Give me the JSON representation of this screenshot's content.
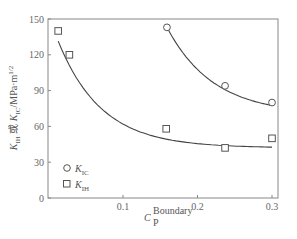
{
  "chart_data": {
    "type": "scatter",
    "title": "",
    "xlabel": "C_P^Boundary",
    "xlabel_main": "C",
    "xlabel_sup": "Boundary",
    "xlabel_sub": "P",
    "ylabel": "K_IH 或 K_IC/MPa·m^1/2",
    "ylabel_parts": {
      "k1": "K",
      "k1_sub": "IH",
      "or": " 或 ",
      "k2": "K",
      "k2_sub": "IC",
      "unit": "/MPa·m",
      "unit_sup": "1/2"
    },
    "xlim": [
      0,
      0.31
    ],
    "ylim": [
      0,
      150
    ],
    "x_ticks": [
      0.1,
      0.2,
      0.3
    ],
    "x_tick_labels": [
      "0.1",
      "0.2",
      "0.3"
    ],
    "y_ticks": [
      0,
      30,
      60,
      90,
      120,
      150
    ],
    "y_tick_labels": [
      "0",
      "30",
      "60",
      "90",
      "120",
      "150"
    ],
    "grid": false,
    "legend_position": "lower-left",
    "series": [
      {
        "name": "K_IC",
        "legend_main": "K",
        "legend_sub": "IC",
        "marker": "circle",
        "x": [
          0.159,
          0.237,
          0.3
        ],
        "y": [
          143,
          94,
          80
        ],
        "fit_curve": true
      },
      {
        "name": "K_IH",
        "legend_main": "K",
        "legend_sub": "IH",
        "marker": "square",
        "x": [
          0.013,
          0.028,
          0.158,
          0.237,
          0.3
        ],
        "y": [
          140,
          120,
          58,
          42,
          50
        ],
        "fit_curve": true
      }
    ]
  }
}
